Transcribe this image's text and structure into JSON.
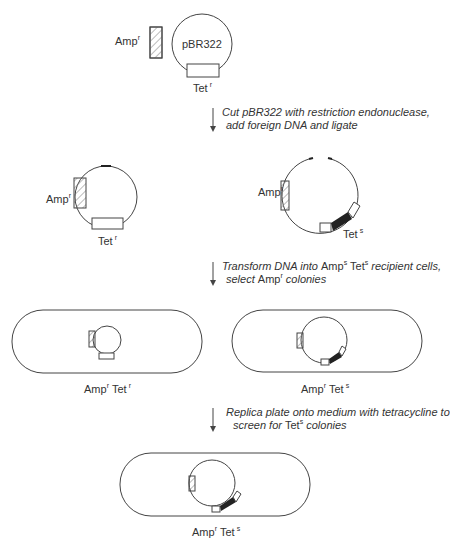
{
  "title_plasmid": {
    "name": "pBR322",
    "amp_label": "Amp",
    "amp_sup": "r",
    "tet_label": "Tet",
    "tet_sup": "r"
  },
  "steps": [
    {
      "line1": "Cut pBR322 with restriction endonuclease,",
      "line2": "add foreign DNA and ligate"
    },
    {
      "line1_a": "Transform DNA into ",
      "line1_b": "Amp",
      "line1_b_sup": "s",
      "line1_c": " Tet",
      "line1_c_sup": "s",
      "line1_d": " recipient cells,",
      "line2_a": "select ",
      "line2_b": "Amp",
      "line2_b_sup": "r",
      "line2_c": " colonies"
    },
    {
      "line1": "Replica plate onto medium with tetracycline to",
      "line2_a": "screen for ",
      "line2_b": "Tet",
      "line2_b_sup": "s",
      "line2_c": " colonies"
    }
  ],
  "ligation_products": {
    "left": {
      "amp_label": "Amp",
      "amp_sup": "r",
      "tet_label": "Tet",
      "tet_sup": "r"
    },
    "right": {
      "amp_label": "Amp",
      "amp_sup": "r",
      "tet_label": "Tet",
      "tet_sup": "s"
    }
  },
  "cells": {
    "left": {
      "amp": "Amp",
      "amp_sup": "r",
      "tet": "Tet",
      "tet_sup": "r"
    },
    "right": {
      "amp": "Amp",
      "amp_sup": "r",
      "tet": "Tet",
      "tet_sup": "s"
    },
    "final": {
      "amp": "Amp",
      "amp_sup": "r",
      "tet": "Tet",
      "tet_sup": "s"
    }
  },
  "colors": {
    "line": "#444444",
    "insert": "#222222",
    "background": "#ffffff"
  }
}
